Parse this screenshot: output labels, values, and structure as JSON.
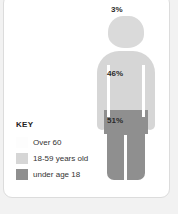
{
  "headline": "THE POPULATION IS YOUNG",
  "card": {
    "background": "#ffffff",
    "border_color": "#dcdcdc"
  },
  "chart_data": {
    "type": "pie",
    "subtype": "pictogram-person",
    "categories": [
      "Over 60",
      "18-59 years old",
      "under age 18"
    ],
    "values": [
      3,
      46,
      51
    ],
    "value_labels": [
      "3%",
      "46%",
      "51%"
    ],
    "colors": [
      "#fdfdfd",
      "#d6d6d6",
      "#8f8f8f"
    ],
    "unit": "%",
    "legend_position": "bottom-left",
    "grid": false
  },
  "figure": {
    "head_label": "3%",
    "torso_label": "46%",
    "legs_label": "51%",
    "head_color": "#dadada",
    "torso_color": "#d6d6d6",
    "legs_color": "#8f8f8f"
  },
  "key": {
    "title": "KEY",
    "items": [
      {
        "label": "Over 60",
        "color": "#fdfdfd"
      },
      {
        "label": "18-59 years old",
        "color": "#d6d6d6"
      },
      {
        "label": "under age 18",
        "color": "#8f8f8f"
      }
    ]
  }
}
